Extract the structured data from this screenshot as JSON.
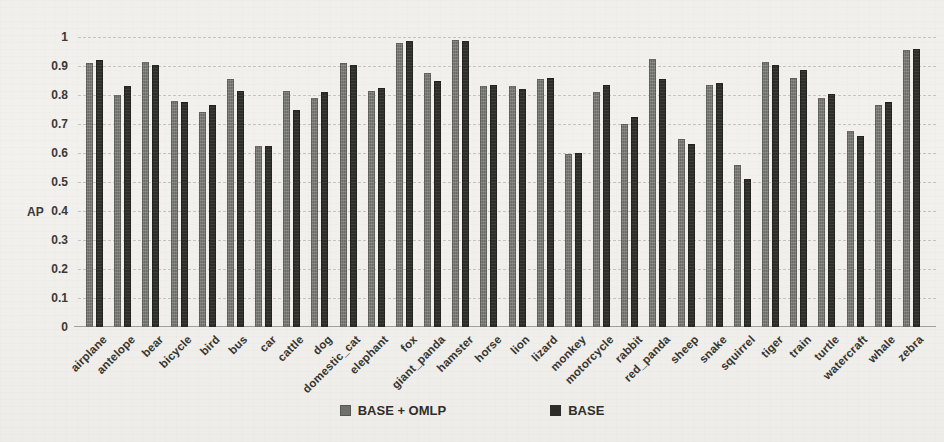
{
  "figure": {
    "background": "#f0efeb",
    "gridline_color": "#7d7b74",
    "text_color": "#3a3936"
  },
  "chart_data": {
    "type": "bar",
    "title": "",
    "xlabel": "",
    "ylabel": "AP",
    "ylim": [
      0,
      1
    ],
    "ytick_step": 0.1,
    "yticks": [
      "1",
      "0.9",
      "0.8",
      "0.7",
      "0.6",
      "0.5",
      "0.4",
      "0.3",
      "0.2",
      "0.1",
      "0"
    ],
    "grid": "horizontal-dashed",
    "legend_position": "bottom-center",
    "categories": [
      "airplane",
      "antelope",
      "bear",
      "bicycle",
      "bird",
      "bus",
      "car",
      "cattle",
      "dog",
      "domestic_cat",
      "elephant",
      "fox",
      "giant_panda",
      "hamster",
      "horse",
      "lion",
      "lizard",
      "monkey",
      "motorcycle",
      "rabbit",
      "red_panda",
      "sheep",
      "snake",
      "squirrel",
      "tiger",
      "train",
      "turtle",
      "watercraft",
      "whale",
      "zebra"
    ],
    "series": [
      {
        "name": "BASE + OMLP",
        "color": "#7b7b77",
        "values": [
          0.91,
          0.8,
          0.915,
          0.78,
          0.74,
          0.855,
          0.625,
          0.815,
          0.79,
          0.91,
          0.815,
          0.98,
          0.875,
          0.99,
          0.83,
          0.83,
          0.855,
          0.595,
          0.81,
          0.7,
          0.925,
          0.65,
          0.835,
          0.56,
          0.915,
          0.86,
          0.79,
          0.675,
          0.765,
          0.955
        ]
      },
      {
        "name": "BASE",
        "color": "#2d2d2a",
        "values": [
          0.92,
          0.83,
          0.905,
          0.775,
          0.765,
          0.815,
          0.625,
          0.75,
          0.81,
          0.905,
          0.825,
          0.985,
          0.85,
          0.985,
          0.835,
          0.82,
          0.86,
          0.6,
          0.835,
          0.725,
          0.855,
          0.63,
          0.84,
          0.51,
          0.905,
          0.885,
          0.805,
          0.66,
          0.775,
          0.96
        ]
      }
    ]
  }
}
